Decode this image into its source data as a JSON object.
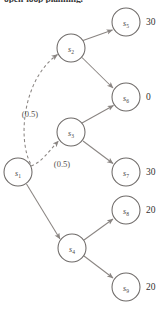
{
  "figure": {
    "caption_clipped": "open-loop planning.",
    "nodes": [
      {
        "id": "s1",
        "base": "s",
        "sub": "1",
        "cx": 18,
        "cy": 172,
        "r": 14
      },
      {
        "id": "s2",
        "base": "s",
        "sub": "2",
        "cx": 71,
        "cy": 48,
        "r": 14
      },
      {
        "id": "s3",
        "base": "s",
        "sub": "3",
        "cx": 71,
        "cy": 132,
        "r": 14
      },
      {
        "id": "s4",
        "base": "s",
        "sub": "4",
        "cx": 72,
        "cy": 248,
        "r": 14
      },
      {
        "id": "s5",
        "base": "s",
        "sub": "5",
        "cx": 126,
        "cy": 22,
        "r": 14
      },
      {
        "id": "s6",
        "base": "s",
        "sub": "6",
        "cx": 126,
        "cy": 97,
        "r": 14
      },
      {
        "id": "s7",
        "base": "s",
        "sub": "7",
        "cx": 126,
        "cy": 172,
        "r": 14
      },
      {
        "id": "s8",
        "base": "s",
        "sub": "8",
        "cx": 126,
        "cy": 210,
        "r": 14
      },
      {
        "id": "s9",
        "base": "s",
        "sub": "9",
        "cx": 126,
        "cy": 287,
        "r": 14
      }
    ],
    "values": [
      {
        "for": "s5",
        "text": "30",
        "x": 146,
        "y": 25
      },
      {
        "for": "s6",
        "text": "0",
        "x": 146,
        "y": 100
      },
      {
        "for": "s7",
        "text": "30",
        "x": 146,
        "y": 175
      },
      {
        "for": "s8",
        "text": "20",
        "x": 146,
        "y": 213
      },
      {
        "for": "s9",
        "text": "20",
        "x": 146,
        "y": 290
      }
    ],
    "edge_labels": [
      {
        "id": "prob-s1-s2",
        "text": "(0.5)",
        "x": 30,
        "y": 117
      },
      {
        "id": "prob-s1-s3",
        "text": "(0.5)",
        "x": 62,
        "y": 167
      }
    ],
    "edges": [
      {
        "from": "s1",
        "to": "s2",
        "style": "dashed"
      },
      {
        "from": "s1",
        "to": "s3",
        "style": "dashed"
      },
      {
        "from": "s1",
        "to": "s4",
        "style": "solid"
      },
      {
        "from": "s2",
        "to": "s5",
        "style": "solid"
      },
      {
        "from": "s2",
        "to": "s6",
        "style": "solid"
      },
      {
        "from": "s3",
        "to": "s6",
        "style": "solid"
      },
      {
        "from": "s3",
        "to": "s7",
        "style": "solid"
      },
      {
        "from": "s4",
        "to": "s8",
        "style": "solid"
      },
      {
        "from": "s4",
        "to": "s9",
        "style": "solid"
      }
    ],
    "colors": {
      "stroke": "#8a8582",
      "node_stroke": "#6e6a68",
      "text": "#35312f",
      "background": "#ffffff"
    }
  }
}
